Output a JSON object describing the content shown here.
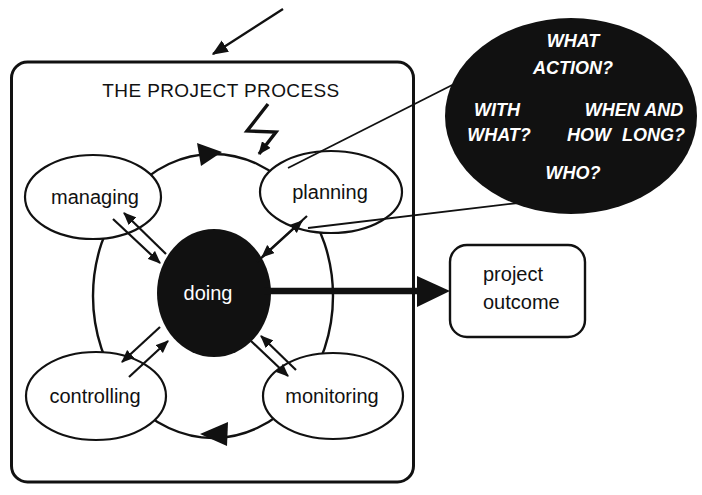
{
  "title": "THE PROJECT PROCESS",
  "nodes": {
    "managing": "managing",
    "planning": "planning",
    "doing": "doing",
    "controlling": "controlling",
    "monitoring": "monitoring"
  },
  "outcome": {
    "line1": "project",
    "line2": "outcome"
  },
  "questions": {
    "what_action_1": "WHAT",
    "what_action_2": "ACTION?",
    "with_what_1": "WITH",
    "with_what_2": "WHAT?",
    "when_long_1": "WHEN AND",
    "when_long_2": "HOW LONG?",
    "who": "WHO?"
  },
  "colors": {
    "ink": "#111111",
    "paper": "#ffffff"
  }
}
